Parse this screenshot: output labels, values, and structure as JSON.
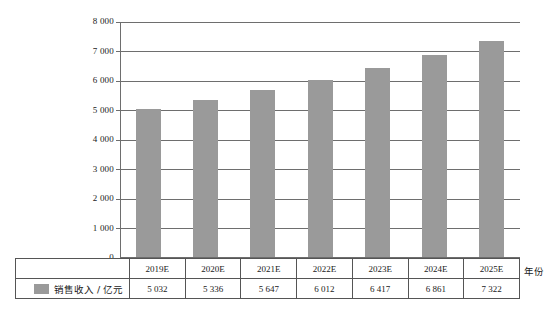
{
  "chart_data": {
    "type": "bar",
    "title": "",
    "xlabel": "年份",
    "ylabel": "销售收入 / 亿元",
    "categories": [
      "2019E",
      "2020E",
      "2021E",
      "2022E",
      "2023E",
      "2024E",
      "2025E"
    ],
    "values": [
      5032,
      5336,
      5647,
      6012,
      6417,
      6861,
      7322
    ],
    "value_labels": [
      "5 032",
      "5 336",
      "5 647",
      "6 012",
      "6 417",
      "6 861",
      "7 322"
    ],
    "series": [
      {
        "name": "销售收入 / 亿元",
        "values": [
          5032,
          5336,
          5647,
          6012,
          6417,
          6861,
          7322
        ],
        "color": "#9a9a9a"
      }
    ],
    "ylim": [
      0,
      8000
    ],
    "ytick_values": [
      0,
      1000,
      2000,
      3000,
      4000,
      5000,
      6000,
      7000,
      8000
    ],
    "ytick_labels": [
      "0",
      "1 000",
      "2 000",
      "3 000",
      "4 000",
      "5 000",
      "6 000",
      "7 000",
      "8 000"
    ],
    "grid": true,
    "legend": "bottom-table",
    "legend_entries": [
      {
        "label": "销售收入 / 亿元",
        "color": "#9a9a9a"
      }
    ]
  },
  "table": {
    "row_header": "销售收入 / 亿元"
  },
  "colors": {
    "bar": "#9a9a9a",
    "grid": "#6e6e6e",
    "border": "#555555",
    "background": "#ffffff"
  }
}
